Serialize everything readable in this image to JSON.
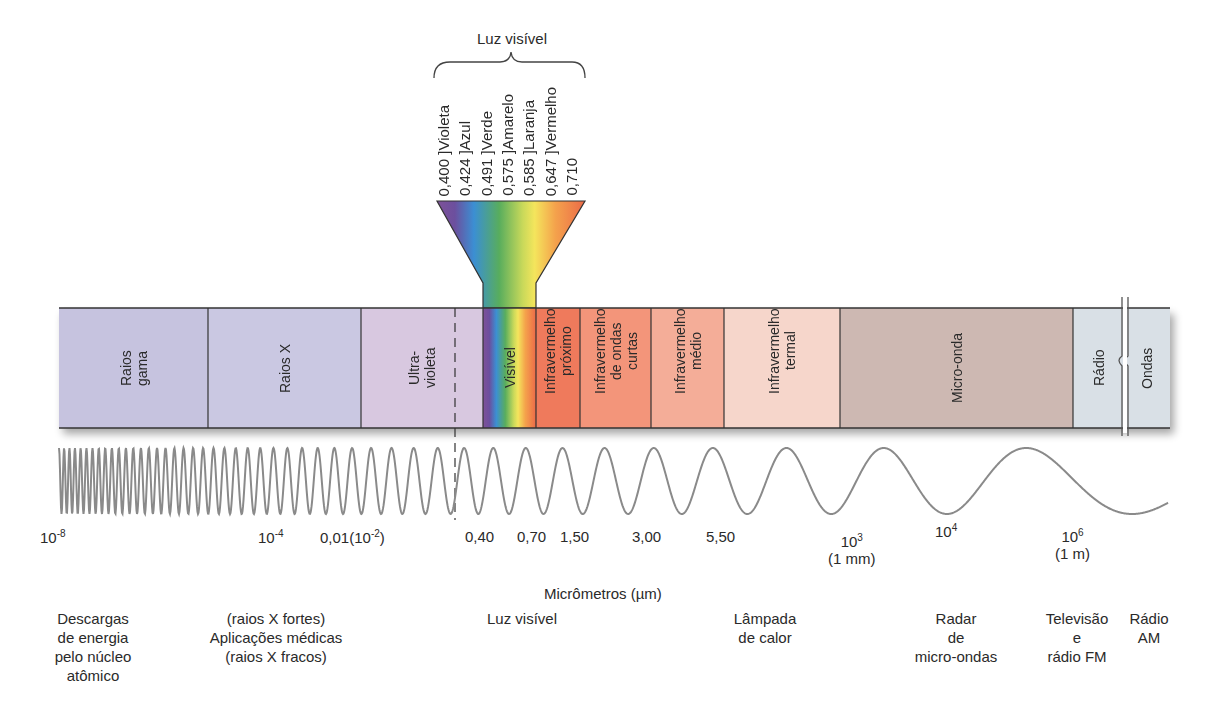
{
  "visible_light": {
    "title": "Luz visível",
    "colors": [
      {
        "wavelength": "0,400",
        "name": "Violeta",
        "color": "#7b4f9a"
      },
      {
        "wavelength": "0,424",
        "name": "Azul",
        "color": "#3a8fd0"
      },
      {
        "wavelength": "0,491",
        "name": "Verde",
        "color": "#5fae5a"
      },
      {
        "wavelength": "0,575",
        "name": "Amarelo",
        "color": "#f2e35a"
      },
      {
        "wavelength": "0,585",
        "name": "Laranja",
        "color": "#f2a24a"
      },
      {
        "wavelength": "0,647",
        "name": "Vermelho",
        "color": "#ec6a4a"
      },
      {
        "wavelength": "0,710",
        "name": "",
        "color": "#e8593d"
      }
    ]
  },
  "bands": [
    {
      "id": "gamma",
      "label": "Raios\ngama",
      "x": 59,
      "w": 149,
      "color": "#c6c3df"
    },
    {
      "id": "xray",
      "label": "Raios X",
      "x": 208,
      "w": 153,
      "color": "#cac8e2"
    },
    {
      "id": "uv",
      "label": "Ultra-\nvioleta",
      "x": 361,
      "w": 122,
      "color": "#d8c8e0"
    },
    {
      "id": "visible",
      "label": "Visível",
      "x": 483,
      "w": 53,
      "color": "rainbow"
    },
    {
      "id": "nir",
      "label": "Infravermelho\npróximo",
      "x": 536,
      "w": 44,
      "color": "#ef7a5c"
    },
    {
      "id": "swir",
      "label": "Infravermelho\nde ondas\ncurtas",
      "x": 580,
      "w": 71,
      "color": "#f3957a"
    },
    {
      "id": "mir",
      "label": "Infravermelho\nmédio",
      "x": 651,
      "w": 73,
      "color": "#f4ad98"
    },
    {
      "id": "tir",
      "label": "Infravermelho\ntermal",
      "x": 724,
      "w": 116,
      "color": "#f6d6cb"
    },
    {
      "id": "microwave",
      "label": "Micro-onda",
      "x": 840,
      "w": 233,
      "color": "#cdb8b2"
    },
    {
      "id": "radio",
      "label": "Rádio",
      "x": 1073,
      "w": 51,
      "color": "#d9e0e6"
    },
    {
      "id": "waves",
      "label": "Ondas",
      "x": 1124,
      "w": 46,
      "color": "#d9e0e6"
    }
  ],
  "scale": {
    "unit_label": "Micrômetros (µm)",
    "ticks": [
      {
        "base": "10",
        "exp": "-8",
        "sub": "",
        "x": 40,
        "y": 528
      },
      {
        "base": "10",
        "exp": "-4",
        "sub": "",
        "x": 258,
        "y": 528
      },
      {
        "base": "0,01(10",
        "exp": "-2",
        "tail": ")",
        "sub": "",
        "x": 320,
        "y": 528
      },
      {
        "base": "0,40",
        "exp": "",
        "sub": "",
        "x": 465,
        "y": 528
      },
      {
        "base": "0,70",
        "exp": "",
        "sub": "",
        "x": 517,
        "y": 528
      },
      {
        "base": "1,50",
        "exp": "",
        "sub": "",
        "x": 560,
        "y": 528
      },
      {
        "base": "3,00",
        "exp": "",
        "sub": "",
        "x": 632,
        "y": 528
      },
      {
        "base": "5,50",
        "exp": "",
        "sub": "",
        "x": 706,
        "y": 528
      },
      {
        "base": "10",
        "exp": "3",
        "sub": "(1 mm)",
        "x": 828,
        "y": 532
      },
      {
        "base": "10",
        "exp": "4",
        "sub": "",
        "x": 935,
        "y": 522
      },
      {
        "base": "10",
        "exp": "6",
        "sub": "(1 m)",
        "x": 1055,
        "y": 527
      }
    ]
  },
  "applications": [
    {
      "text": "Descargas\nde energia\npelo núcleo\natômico",
      "x": 93
    },
    {
      "text": "(raios X fortes)\nAplicações médicas\n(raios X fracos)",
      "x": 276
    },
    {
      "text": "Luz visível",
      "x": 522
    },
    {
      "text": "Lâmpada\nde calor",
      "x": 765
    },
    {
      "text": "Radar\nde\nmicro-ondas",
      "x": 956
    },
    {
      "text": "Televisão\ne\nrádio FM",
      "x": 1077
    },
    {
      "text": "Rádio\nAM",
      "x": 1149
    }
  ]
}
